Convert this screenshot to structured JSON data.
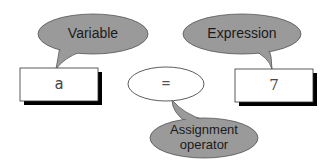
{
  "diagram": {
    "title": "",
    "callouts": {
      "variable": {
        "label": "Variable"
      },
      "expression": {
        "label": "Expression"
      },
      "operator": {
        "line1": "Assignment",
        "line2": "operator"
      }
    },
    "statement": {
      "variable_box": {
        "value": "a"
      },
      "operator_ellipse": {
        "value": "="
      },
      "expression_box": {
        "value": "7"
      }
    },
    "colors": {
      "callout_fill": "#9a9a9a",
      "callout_stroke": "#555555",
      "box_fill": "#ffffff",
      "box_shadow": "#000000",
      "text": "#1a1a1a"
    }
  }
}
